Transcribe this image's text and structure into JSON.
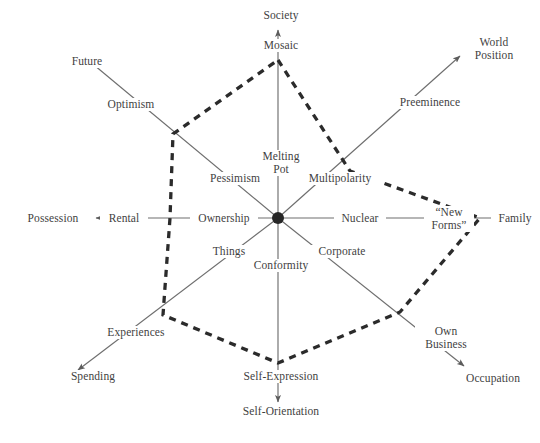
{
  "figure": {
    "type": "radar-axes-diagram",
    "title": "",
    "background_color": "#ffffff",
    "axis_line_color": "#6e6e6e",
    "polygon_color": "#2b2b2b",
    "text_color": "#3f3f3f",
    "center": {
      "x": 278,
      "y": 218,
      "hub_radius": 6
    }
  },
  "chart_data": {
    "type": "radar",
    "title": "",
    "xlabel": "",
    "ylabel": "",
    "grid": false,
    "legend": "none",
    "center": [
      278,
      218
    ],
    "axis_count": 8,
    "categories": [
      "Society / Mosaic (Melting Pot)",
      "World Position / Preeminence (Multipolarity)",
      "Family / “New Forms” (Nuclear)",
      "Occupation / Own Business (Corporate)",
      "Self-Orientation / Self-Expression (Conformity)",
      "Spending / Experiences (Things)",
      "Possession / Rental (Ownership)",
      "Future / Optimism (Pessimism)"
    ],
    "values": [
      1.0,
      0.62,
      1.0,
      0.62,
      1.0,
      0.62,
      0.55,
      0.62
    ],
    "series": [
      {
        "name": "Trend polygon",
        "style": "dashed",
        "vertices_px": [
          [
            278,
            60
          ],
          [
            350,
            171
          ],
          [
            480,
            218
          ],
          [
            400,
            312
          ],
          [
            278,
            363
          ],
          [
            163,
            315
          ],
          [
            170,
            218
          ],
          [
            173,
            134
          ]
        ]
      }
    ],
    "axes": [
      {
        "direction": "up",
        "inner_label": "Melting Pot",
        "mid_label": "Mosaic",
        "outer_label": "Society",
        "arrow": true
      },
      {
        "direction": "up-right",
        "inner_label": "Multipolarity",
        "mid_label": "Preeminence",
        "outer_label": "World Position",
        "arrow": true
      },
      {
        "direction": "right",
        "inner_label": "Nuclear",
        "mid_label": "“New Forms”",
        "outer_label": "Family",
        "arrow": true
      },
      {
        "direction": "down-right",
        "inner_label": "Corporate",
        "mid_label": "Own Business",
        "outer_label": "Occupation",
        "arrow": true
      },
      {
        "direction": "down",
        "inner_label": "Conformity",
        "mid_label": "Self-Expression",
        "outer_label": "Self-Orientation",
        "arrow": true
      },
      {
        "direction": "down-left",
        "inner_label": "Things",
        "mid_label": "Experiences",
        "outer_label": "Spending",
        "arrow": true
      },
      {
        "direction": "left",
        "inner_label": "Ownership",
        "mid_label": "Rental",
        "outer_label": "Possession",
        "arrow": true
      },
      {
        "direction": "up-left",
        "inner_label": "Pessimism",
        "mid_label": "Optimism",
        "outer_label": "Future",
        "arrow": true
      }
    ]
  },
  "labels": {
    "society": "Society",
    "mosaic": "Mosaic",
    "melting_pot_line1": "Melting",
    "melting_pot_line2": "Pot",
    "world_position_line1": "World",
    "world_position_line2": "Position",
    "preeminence": "Preeminence",
    "multipolarity": "Multipolarity",
    "family": "Family",
    "new_forms_line1": "“New",
    "new_forms_line2": "Forms”",
    "nuclear": "Nuclear",
    "occupation": "Occupation",
    "own_business_line1": "Own",
    "own_business_line2": "Business",
    "corporate": "Corporate",
    "self_orientation": "Self-Orientation",
    "self_expression": "Self-Expression",
    "conformity": "Conformity",
    "spending": "Spending",
    "experiences": "Experiences",
    "things": "Things",
    "possession": "Possession",
    "rental": "Rental",
    "ownership": "Ownership",
    "future": "Future",
    "optimism": "Optimism",
    "pessimism": "Pessimism"
  }
}
